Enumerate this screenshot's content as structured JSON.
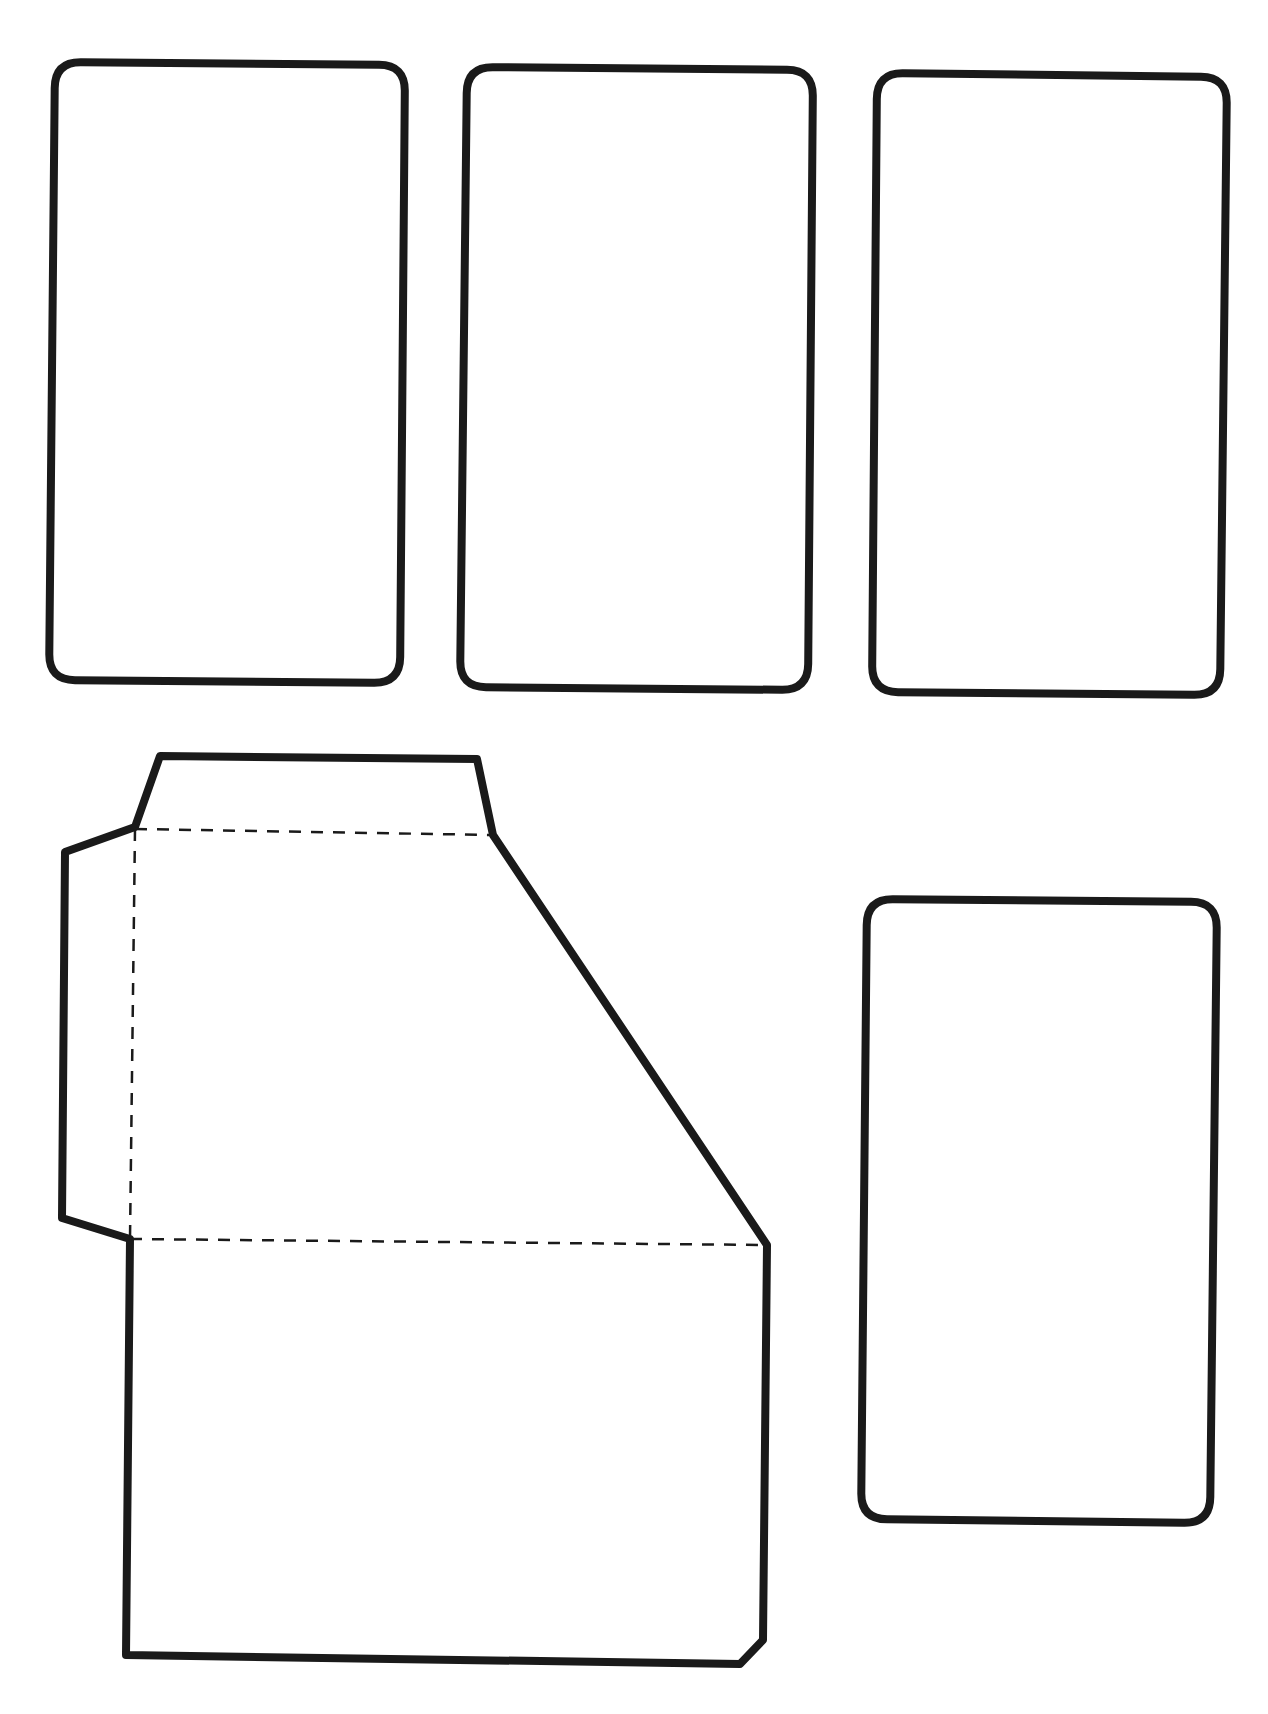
{
  "page": {
    "background": "#ffffff",
    "width": 1268,
    "height": 1714
  },
  "style": {
    "cut_line_color": "#1a1a1a",
    "cut_line_width": 8,
    "fold_line_color": "#1a1a1a",
    "fold_line_width": 2.5,
    "fold_dash": "12 10"
  },
  "cards": [
    {
      "id": "card-1",
      "corners": {
        "tl": [
          55,
          62
        ],
        "tr": [
          405,
          65
        ],
        "br": [
          400,
          683
        ],
        "bl": [
          49,
          680
        ]
      },
      "radius": 26
    },
    {
      "id": "card-2",
      "corners": {
        "tl": [
          467,
          67
        ],
        "tr": [
          813,
          70
        ],
        "br": [
          808,
          690
        ],
        "bl": [
          460,
          687
        ]
      },
      "radius": 26
    },
    {
      "id": "card-3",
      "corners": {
        "tl": [
          877,
          73
        ],
        "tr": [
          1227,
          77
        ],
        "br": [
          1220,
          695
        ],
        "bl": [
          872,
          692
        ]
      },
      "radius": 26
    },
    {
      "id": "card-4",
      "corners": {
        "tl": [
          867,
          899
        ],
        "tr": [
          1217,
          902
        ],
        "br": [
          1210,
          1523
        ],
        "bl": [
          861,
          1519
        ]
      },
      "radius": 26
    }
  ],
  "pocket": {
    "outline_points": [
      [
        160,
        756
      ],
      [
        477,
        759
      ],
      [
        493,
        835
      ],
      [
        767,
        1245
      ],
      [
        763,
        1640
      ],
      [
        740,
        1664
      ],
      [
        126,
        1655
      ],
      [
        130,
        1239
      ],
      [
        62,
        1218
      ],
      [
        65,
        852
      ],
      [
        135,
        827
      ]
    ],
    "fold_lines": [
      {
        "name": "top-flap-fold",
        "from": [
          135,
          829
        ],
        "to": [
          493,
          835
        ]
      },
      {
        "name": "side-tab-fold",
        "from": [
          135,
          829
        ],
        "to": [
          130,
          1239
        ]
      },
      {
        "name": "bottom-fold",
        "from": [
          130,
          1239
        ],
        "to": [
          767,
          1245
        ]
      }
    ]
  }
}
